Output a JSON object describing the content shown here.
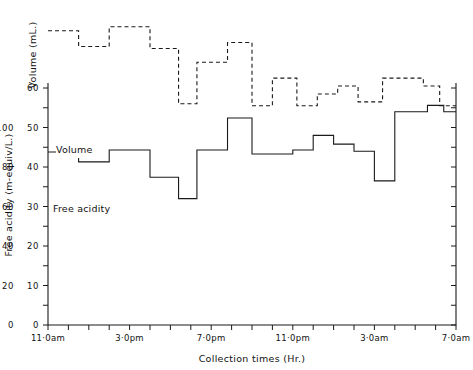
{
  "figure": {
    "background_color": "#ffffff",
    "line_color": "#1a1a1a"
  },
  "axes": {
    "x_title": "Collection times (Hr.)",
    "y_left_outer_title": "Free acidity (m-equiv/L.)",
    "y_left_inner_title": "Volume (mL.)",
    "acidity_ticks": [
      "0",
      "20",
      "40",
      "60",
      "80",
      "100"
    ],
    "volume_ticks": [
      "0",
      "10",
      "20",
      "30",
      "40",
      "50",
      "60"
    ],
    "x_tick_labels": [
      "11·0am",
      "3·0pm",
      "7·0pm",
      "11·0pm",
      "3·0am",
      "7·0am"
    ]
  },
  "series_labels": {
    "volume": "Volume",
    "acidity": "Free acidity"
  },
  "chart_data": {
    "type": "line",
    "title": "",
    "subtitle": "",
    "xlabel": "Collection times (Hr.)",
    "ylabel": "Volume (mL.)",
    "ylabel_secondary": "Free acidity (m-equiv/L.)",
    "grid": false,
    "legend": "inline-annotations",
    "step_style": "post",
    "xlim": [
      11,
      31
    ],
    "x_tick_hours": [
      11,
      12,
      13,
      14,
      15,
      16,
      17,
      18,
      19,
      20,
      21,
      22,
      23,
      24,
      25,
      26,
      27,
      28,
      29,
      30,
      31
    ],
    "x_labeled_hours": [
      11,
      15,
      19,
      23,
      27,
      31
    ],
    "x": [
      11,
      12,
      13,
      14,
      15,
      16,
      17,
      18,
      19,
      20,
      21,
      22,
      23,
      24,
      25,
      26,
      27,
      28,
      29,
      30,
      31
    ],
    "ylim_volume": [
      0,
      62
    ],
    "ylim_acidity": [
      0,
      124
    ],
    "series": [
      {
        "name": "Volume",
        "unit": "mL.",
        "axis": "left-inner",
        "values": [
          43.8,
          43.8,
          41.3,
          41.3,
          44.3,
          44.3,
          37.4,
          37.4,
          37.4,
          32.0,
          32.0,
          44.3,
          44.3,
          52.4,
          52.4,
          43.3,
          43.3,
          43.3,
          44.3,
          44.3,
          44.3
        ]
      },
      {
        "name": "Free acidity",
        "unit": "m-equiv/L.",
        "axis": "left-outer",
        "values": [
          74.5,
          74.5,
          70.5,
          70.5,
          75.5,
          75.5,
          70.0,
          70.0,
          70.0,
          58.5,
          58.5,
          66.5,
          66.5,
          71.5,
          71.5,
          58.5,
          58.5,
          58.5,
          63.0,
          63.0,
          63.0
        ]
      }
    ],
    "volume_steps": [
      {
        "x0": 11.0,
        "x1": 12.5,
        "y": 43.8
      },
      {
        "x0": 12.5,
        "x1": 14.0,
        "y": 41.3
      },
      {
        "x0": 14.0,
        "x1": 16.0,
        "y": 44.3
      },
      {
        "x0": 16.0,
        "x1": 17.4,
        "y": 37.4
      },
      {
        "x0": 17.4,
        "x1": 18.3,
        "y": 32.0
      },
      {
        "x0": 18.3,
        "x1": 19.8,
        "y": 44.3
      },
      {
        "x0": 19.8,
        "x1": 21.0,
        "y": 52.4
      },
      {
        "x0": 21.0,
        "x1": 23.0,
        "y": 43.3
      },
      {
        "x0": 23.0,
        "x1": 24.0,
        "y": 44.3
      },
      {
        "x0": 24.0,
        "x1": 25.0,
        "y": 48.0
      },
      {
        "x0": 25.0,
        "x1": 26.0,
        "y": 45.8
      },
      {
        "x0": 26.0,
        "x1": 27.0,
        "y": 44.0
      },
      {
        "x0": 27.0,
        "x1": 28.0,
        "y": 36.5
      },
      {
        "x0": 28.0,
        "x1": 29.6,
        "y": 54.0
      },
      {
        "x0": 29.6,
        "x1": 30.4,
        "y": 55.6
      },
      {
        "x0": 30.4,
        "x1": 31.0,
        "y": 54.0
      }
    ],
    "acidity_steps": [
      {
        "x0": 11.0,
        "x1": 12.5,
        "y": 74.5
      },
      {
        "x0": 12.5,
        "x1": 14.0,
        "y": 70.5
      },
      {
        "x0": 14.0,
        "x1": 16.0,
        "y": 75.5
      },
      {
        "x0": 16.0,
        "x1": 17.4,
        "y": 70.0
      },
      {
        "x0": 17.4,
        "x1": 18.3,
        "y": 56.0
      },
      {
        "x0": 18.3,
        "x1": 19.8,
        "y": 66.5
      },
      {
        "x0": 19.8,
        "x1": 21.0,
        "y": 71.5
      },
      {
        "x0": 21.0,
        "x1": 22.0,
        "y": 55.5
      },
      {
        "x0": 22.0,
        "x1": 23.2,
        "y": 62.5
      },
      {
        "x0": 23.2,
        "x1": 24.2,
        "y": 55.5
      },
      {
        "x0": 24.2,
        "x1": 25.2,
        "y": 58.5
      },
      {
        "x0": 25.2,
        "x1": 26.2,
        "y": 60.5
      },
      {
        "x0": 26.2,
        "x1": 27.4,
        "y": 56.5
      },
      {
        "x0": 27.4,
        "x1": 29.4,
        "y": 62.5
      },
      {
        "x0": 29.4,
        "x1": 30.2,
        "y": 60.5
      },
      {
        "x0": 30.2,
        "x1": 31.0,
        "y": 55.5
      }
    ]
  }
}
